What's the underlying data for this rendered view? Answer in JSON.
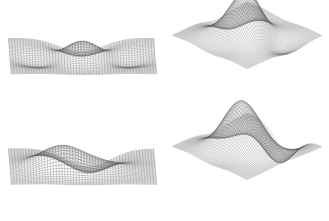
{
  "figure": {
    "kind": "multi-panel-3d-wireframe-surface-figure",
    "background_color": "#ffffff",
    "line_color": "#555555",
    "panel_count": 4,
    "layout": "2x2",
    "width": 329,
    "height": 221
  },
  "chart_data": [
    {
      "id": "top-left",
      "type": "line",
      "render": "wireframe-surface-3d",
      "title": "",
      "xlabel": "",
      "ylabel": "",
      "zlabel": "",
      "projection": "rectangular-front-elevation",
      "azimuth_deg": 0,
      "elevation_deg": 10,
      "grid": true,
      "grid_nx": 52,
      "grid_ny": 34,
      "xlim": [
        -3,
        3
      ],
      "ylim": [
        -3,
        3
      ],
      "zlim": [
        -0.9,
        1.2
      ],
      "surface_expression": "peaks-like symmetric double-valley with central ridge",
      "features": [
        {
          "name": "central-ridge",
          "x": 0.0,
          "y": 0.0,
          "z": 1.0
        },
        {
          "name": "left-valley",
          "x": -1.4,
          "y": 0.2,
          "z": -0.55
        },
        {
          "name": "right-valley",
          "x": 1.4,
          "y": 0.2,
          "z": -0.55
        },
        {
          "name": "front-notch",
          "x": 0.0,
          "y": -2.6,
          "z": -0.75
        }
      ]
    },
    {
      "id": "top-right",
      "type": "line",
      "render": "wireframe-surface-3d",
      "title": "",
      "xlabel": "",
      "ylabel": "",
      "zlabel": "",
      "projection": "isometric-diamond",
      "azimuth_deg": 45,
      "elevation_deg": 22,
      "grid": true,
      "grid_nx": 60,
      "grid_ny": 60,
      "xlim": [
        -3,
        3
      ],
      "ylim": [
        -3,
        3
      ],
      "zlim": [
        -0.9,
        1.2
      ],
      "surface_expression": "peaks-like mountain with central summit and flanking shoulders",
      "features": [
        {
          "name": "summit",
          "x": 0.0,
          "y": 0.0,
          "z": 1.0
        },
        {
          "name": "left-shoulder",
          "x": -1.3,
          "y": 0.4,
          "z": 0.35
        },
        {
          "name": "right-shoulder",
          "x": 1.2,
          "y": 0.3,
          "z": 0.3
        },
        {
          "name": "left-hollow",
          "x": -1.6,
          "y": -0.4,
          "z": -0.45
        },
        {
          "name": "right-hollow",
          "x": 1.6,
          "y": -0.5,
          "z": -0.4
        }
      ]
    },
    {
      "id": "bottom-left",
      "type": "line",
      "render": "wireframe-surface-3d",
      "title": "",
      "xlabel": "",
      "ylabel": "",
      "zlabel": "",
      "projection": "rectangular-front-elevation",
      "azimuth_deg": 0,
      "elevation_deg": 10,
      "grid": true,
      "grid_nx": 52,
      "grid_ny": 34,
      "xlim": [
        -3,
        3
      ],
      "ylim": [
        -3,
        3
      ],
      "zlim": [
        -1.0,
        1.4
      ],
      "surface_expression": "asymmetric single tall peak left with broad basin right and downward spike",
      "features": [
        {
          "name": "tall-peak",
          "x": -0.9,
          "y": 0.1,
          "z": 1.35
        },
        {
          "name": "broad-basin",
          "x": 0.9,
          "y": 0.0,
          "z": 0.55
        },
        {
          "name": "deep-trough",
          "x": 0.4,
          "y": -1.0,
          "z": -0.75
        },
        {
          "name": "downward-spike",
          "x": 0.3,
          "y": -2.8,
          "z": -1.0
        }
      ]
    },
    {
      "id": "bottom-right",
      "type": "line",
      "render": "wireframe-surface-3d",
      "title": "",
      "xlabel": "",
      "ylabel": "",
      "zlabel": "",
      "projection": "isometric-diamond",
      "azimuth_deg": 45,
      "elevation_deg": 22,
      "grid": true,
      "grid_nx": 60,
      "grid_ny": 60,
      "xlim": [
        -3,
        3
      ],
      "ylim": [
        -3,
        3
      ],
      "zlim": [
        -1.0,
        1.4
      ],
      "surface_expression": "asymmetric mountain with offset summit, ridge spurs and frontal dimple",
      "features": [
        {
          "name": "summit",
          "x": -0.7,
          "y": 0.2,
          "z": 1.3
        },
        {
          "name": "secondary-rise",
          "x": 0.9,
          "y": 0.1,
          "z": 0.6
        },
        {
          "name": "left-hollow",
          "x": -1.7,
          "y": -0.3,
          "z": -0.5
        },
        {
          "name": "front-dimple",
          "x": 0.2,
          "y": -2.4,
          "z": -0.85
        }
      ]
    }
  ]
}
